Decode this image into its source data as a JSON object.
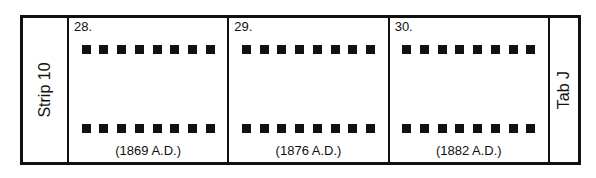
{
  "strip_label": "Strip 10",
  "tab_label": "Tab J",
  "frames": [
    {
      "number": "28.",
      "date": "(1869 A.D.)"
    },
    {
      "number": "29.",
      "date": "(1876 A.D.)"
    },
    {
      "number": "30.",
      "date": "(1882 A.D.)"
    }
  ],
  "holes_per_row": 8
}
